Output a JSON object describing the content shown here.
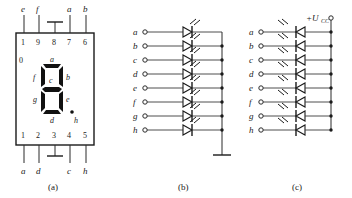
{
  "figure": {
    "captions": {
      "a": "(a)",
      "b": "(b)",
      "c": "(c)"
    }
  },
  "panel_a": {
    "name": "seven-segment-display-package",
    "corner_mark": "0",
    "top_pin_numbers": [
      "1",
      "9",
      "8",
      "7",
      "6"
    ],
    "bottom_pin_numbers": [
      "1",
      "2",
      "3",
      "4",
      "5"
    ],
    "top_pin_labels": [
      "e",
      "f",
      "",
      "a",
      "b"
    ],
    "bottom_pin_labels": [
      "a",
      "d",
      "",
      "c",
      "h"
    ],
    "top_ground_pin": "8",
    "bottom_ground_pin": "3",
    "segment_labels": {
      "top": "a",
      "upper_left": "f",
      "upper_right": "b",
      "middle": "c",
      "lower_left": "g",
      "lower_right": "e",
      "bottom": "d",
      "decimal_point": "h"
    }
  },
  "panel_b": {
    "name": "common-cathode-array",
    "terminal_labels": [
      "a",
      "b",
      "c",
      "d",
      "e",
      "f",
      "g",
      "h"
    ],
    "rail": "ground",
    "rail_label": "",
    "diode_direction": "anode-left-cathode-right",
    "junction_rows": [
      "b",
      "c",
      "d",
      "e",
      "f",
      "g",
      "h"
    ]
  },
  "panel_c": {
    "name": "common-anode-array",
    "terminal_labels": [
      "a",
      "b",
      "c",
      "d",
      "e",
      "f",
      "g",
      "h"
    ],
    "rail": "supply",
    "rail_label": "+U",
    "rail_label_sub": "CC",
    "diode_direction": "cathode-left-anode-right",
    "junction_rows": [
      "a",
      "b",
      "c",
      "d",
      "e",
      "f",
      "g",
      "h"
    ]
  }
}
